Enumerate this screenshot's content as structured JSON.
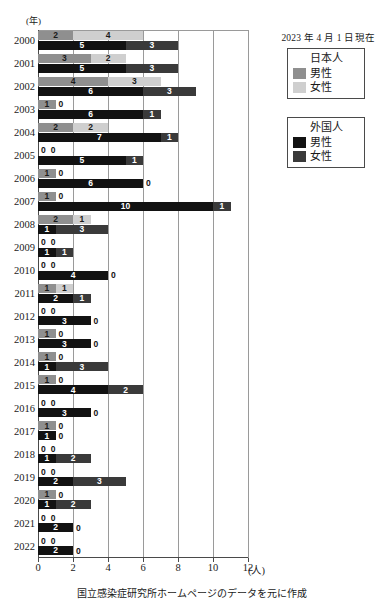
{
  "note": "2023 年 4 月 1 日現在",
  "axis_year_label": "(年)",
  "caption": "国立感染症研究所ホームページのデータを元に作成",
  "colors": {
    "jp_male": "#8f8f8f",
    "jp_female": "#cfcfcf",
    "fr_male": "#121212",
    "fr_female": "#3a3a3a",
    "grid": "#9a9a9a",
    "axis": "#4a4a4a"
  },
  "legend": {
    "japanese": {
      "title": "日本人",
      "items": [
        {
          "label": "男性",
          "color": "#8f8f8f"
        },
        {
          "label": "女性",
          "color": "#cfcfcf"
        }
      ]
    },
    "foreign": {
      "title": "外国人",
      "items": [
        {
          "label": "男性",
          "color": "#121212"
        },
        {
          "label": "女性",
          "color": "#3a3a3a"
        }
      ]
    }
  },
  "xaxis": {
    "ticks": [
      0,
      2,
      4,
      6,
      8,
      10,
      12
    ],
    "unit": "(人)",
    "min": 0,
    "max": 12
  },
  "chart_data": {
    "type": "bar",
    "orientation": "horizontal",
    "stacked": true,
    "title": "",
    "xlabel": "(人)",
    "ylabel": "(年)",
    "xlim": [
      0,
      12
    ],
    "grid": true,
    "legend_position": "right",
    "categories": [
      "2000",
      "2001",
      "2002",
      "2003",
      "2004",
      "2005",
      "2006",
      "2007",
      "2008",
      "2009",
      "2010",
      "2011",
      "2012",
      "2013",
      "2014",
      "2015",
      "2016",
      "2017",
      "2018",
      "2019",
      "2020",
      "2021",
      "2022"
    ],
    "series": [
      {
        "name": "日本人 男性",
        "group": "日本人",
        "color": "#8f8f8f",
        "values": [
          2,
          3,
          4,
          1,
          2,
          0,
          1,
          1,
          2,
          0,
          0,
          1,
          0,
          1,
          1,
          1,
          0,
          1,
          0,
          0,
          1,
          0,
          0
        ]
      },
      {
        "name": "日本人 女性",
        "group": "日本人",
        "color": "#cfcfcf",
        "values": [
          4,
          2,
          3,
          0,
          2,
          0,
          0,
          0,
          1,
          0,
          0,
          1,
          0,
          0,
          0,
          0,
          0,
          0,
          0,
          0,
          0,
          0,
          0
        ]
      },
      {
        "name": "外国人 男性",
        "group": "外国人",
        "color": "#121212",
        "values": [
          5,
          5,
          6,
          6,
          7,
          5,
          6,
          10,
          1,
          1,
          4,
          2,
          3,
          3,
          1,
          4,
          3,
          1,
          1,
          2,
          1,
          2,
          2
        ]
      },
      {
        "name": "外国人 女性",
        "group": "外国人",
        "color": "#3a3a3a",
        "values": [
          3,
          3,
          3,
          1,
          1,
          1,
          0,
          1,
          3,
          1,
          0,
          1,
          0,
          0,
          3,
          2,
          0,
          0,
          2,
          3,
          2,
          0,
          0
        ]
      }
    ],
    "rows": [
      {
        "year": "2000",
        "jp": {
          "male": 2,
          "female": 4
        },
        "fr": {
          "male": 5,
          "female": 3
        }
      },
      {
        "year": "2001",
        "jp": {
          "male": 3,
          "female": 2
        },
        "fr": {
          "male": 5,
          "female": 3
        }
      },
      {
        "year": "2002",
        "jp": {
          "male": 4,
          "female": 3
        },
        "fr": {
          "male": 6,
          "female": 3
        }
      },
      {
        "year": "2003",
        "jp": {
          "male": 1,
          "female": 0
        },
        "fr": {
          "male": 6,
          "female": 1
        }
      },
      {
        "year": "2004",
        "jp": {
          "male": 2,
          "female": 2
        },
        "fr": {
          "male": 7,
          "female": 1
        }
      },
      {
        "year": "2005",
        "jp": {
          "male": 0,
          "female": 0
        },
        "fr": {
          "male": 5,
          "female": 1
        }
      },
      {
        "year": "2006",
        "jp": {
          "male": 1,
          "female": 0
        },
        "fr": {
          "male": 6,
          "female": 0
        }
      },
      {
        "year": "2007",
        "jp": {
          "male": 1,
          "female": 0
        },
        "fr": {
          "male": 10,
          "female": 1
        }
      },
      {
        "year": "2008",
        "jp": {
          "male": 2,
          "female": 1
        },
        "fr": {
          "male": 1,
          "female": 3
        }
      },
      {
        "year": "2009",
        "jp": {
          "male": 0,
          "female": 0
        },
        "fr": {
          "male": 1,
          "female": 1
        }
      },
      {
        "year": "2010",
        "jp": {
          "male": 0,
          "female": 0
        },
        "fr": {
          "male": 4,
          "female": 0
        }
      },
      {
        "year": "2011",
        "jp": {
          "male": 1,
          "female": 1
        },
        "fr": {
          "male": 2,
          "female": 1
        }
      },
      {
        "year": "2012",
        "jp": {
          "male": 0,
          "female": 0
        },
        "fr": {
          "male": 3,
          "female": 0
        }
      },
      {
        "year": "2013",
        "jp": {
          "male": 1,
          "female": 0
        },
        "fr": {
          "male": 3,
          "female": 0
        }
      },
      {
        "year": "2014",
        "jp": {
          "male": 1,
          "female": 0
        },
        "fr": {
          "male": 1,
          "female": 3
        }
      },
      {
        "year": "2015",
        "jp": {
          "male": 1,
          "female": 0
        },
        "fr": {
          "male": 4,
          "female": 2
        }
      },
      {
        "year": "2016",
        "jp": {
          "male": 0,
          "female": 0
        },
        "fr": {
          "male": 3,
          "female": 0
        }
      },
      {
        "year": "2017",
        "jp": {
          "male": 1,
          "female": 0
        },
        "fr": {
          "male": 1,
          "female": 0
        }
      },
      {
        "year": "2018",
        "jp": {
          "male": 0,
          "female": 0
        },
        "fr": {
          "male": 1,
          "female": 2
        }
      },
      {
        "year": "2019",
        "jp": {
          "male": 0,
          "female": 0
        },
        "fr": {
          "male": 2,
          "female": 3
        }
      },
      {
        "year": "2020",
        "jp": {
          "male": 1,
          "female": 0
        },
        "fr": {
          "male": 1,
          "female": 2
        }
      },
      {
        "year": "2021",
        "jp": {
          "male": 0,
          "female": 0
        },
        "fr": {
          "male": 2,
          "female": 0
        }
      },
      {
        "year": "2022",
        "jp": {
          "male": 0,
          "female": 0
        },
        "fr": {
          "male": 2,
          "female": 0
        }
      }
    ]
  }
}
